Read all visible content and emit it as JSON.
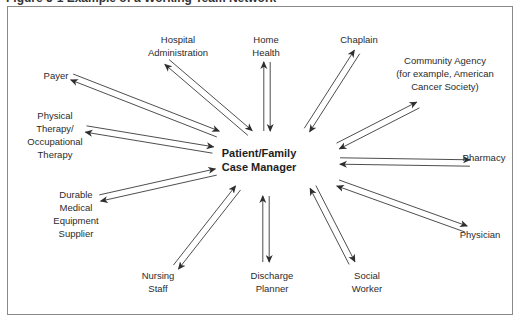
{
  "figure": {
    "title": "Figure 5-1 Example of a Working Team Network"
  },
  "diagram": {
    "center": {
      "lines": [
        "Patient/Family",
        "Case Manager"
      ]
    },
    "nodes": [
      {
        "id": "hospital-administration",
        "lines": [
          "Hospital",
          "Administration"
        ]
      },
      {
        "id": "home-health",
        "lines": [
          "Home",
          "Health"
        ]
      },
      {
        "id": "chaplain",
        "lines": [
          "Chaplain"
        ]
      },
      {
        "id": "community-agency",
        "lines": [
          "Community Agency",
          "(for example, American",
          "Cancer Society)"
        ]
      },
      {
        "id": "payer",
        "lines": [
          "Payer"
        ]
      },
      {
        "id": "physical-occupational-therapy",
        "lines": [
          "Physical",
          "Therapy/",
          "Occupational",
          "Therapy"
        ]
      },
      {
        "id": "pharmacy",
        "lines": [
          "Pharmacy"
        ]
      },
      {
        "id": "durable-medical-equipment-supplier",
        "lines": [
          "Durable",
          "Medical",
          "Equipment",
          "Supplier"
        ]
      },
      {
        "id": "physician",
        "lines": [
          "Physician"
        ]
      },
      {
        "id": "nursing-staff",
        "lines": [
          "Nursing",
          "Staff"
        ]
      },
      {
        "id": "discharge-planner",
        "lines": [
          "Discharge",
          "Planner"
        ]
      },
      {
        "id": "social-worker",
        "lines": [
          "Social",
          "Worker"
        ]
      }
    ],
    "connections": "bidirectional pair of arrows between each node and the center",
    "colors": {
      "line": "#3a3a3a",
      "frame": "#8a8a8a",
      "text": "#2b2b2b"
    }
  }
}
